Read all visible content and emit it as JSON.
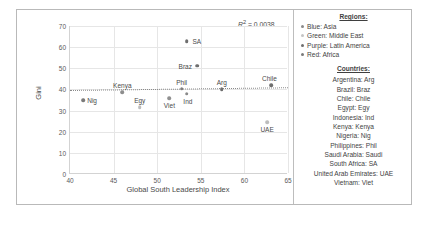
{
  "chart_data": {
    "type": "scatter",
    "title": "",
    "xlabel": "Global South Leadership Index",
    "ylabel": "Gini",
    "xlim": [
      40,
      65
    ],
    "ylim": [
      0,
      70
    ],
    "xticks": [
      40,
      45,
      50,
      55,
      60,
      65
    ],
    "yticks": [
      0,
      10,
      20,
      30,
      40,
      50,
      60,
      70
    ],
    "grid": true,
    "annotation": "R² = 0.0038",
    "r2_prefix": "R",
    "r2_sup": "2",
    "r2_value": "= 0.0038",
    "trendline": {
      "x0": 40,
      "y0": 39.6,
      "x1": 65,
      "y1": 40.9,
      "style": "dotted"
    },
    "points": [
      {
        "label": "Nig",
        "x": 41.5,
        "y": 35.0,
        "color": "#7a7a7a",
        "label_dx": 9,
        "label_dy": 0
      },
      {
        "label": "Kenya",
        "x": 46.0,
        "y": 38.7,
        "color": "#8d8d8d",
        "label_dx": 0,
        "label_dy": -7
      },
      {
        "label": "Egy",
        "x": 48.0,
        "y": 31.5,
        "color": "#bdbdbd",
        "label_dx": 0,
        "label_dy": -7
      },
      {
        "label": "Viet",
        "x": 51.4,
        "y": 35.8,
        "color": "#909090",
        "label_dx": 0,
        "label_dy": 7
      },
      {
        "label": "Phil",
        "x": 52.8,
        "y": 40.3,
        "color": "#7d7d7d",
        "label_dx": 0,
        "label_dy": -7
      },
      {
        "label": "Ind",
        "x": 53.4,
        "y": 38.0,
        "color": "#8a8a8a",
        "label_dx": 1,
        "label_dy": 7
      },
      {
        "label": "SA",
        "x": 53.4,
        "y": 62.8,
        "color": "#6e6e6e",
        "label_dx": 10,
        "label_dy": 0
      },
      {
        "label": "Braz",
        "x": 54.6,
        "y": 51.3,
        "color": "#6e6e6e",
        "label_dx": -12,
        "label_dy": 0
      },
      {
        "label": "Arg",
        "x": 57.4,
        "y": 40.0,
        "color": "#6e6e6e",
        "label_dx": 0,
        "label_dy": -7
      },
      {
        "label": "Chile",
        "x": 63.1,
        "y": 42.0,
        "color": "#6e6e6e",
        "label_dx": -2,
        "label_dy": -7
      },
      {
        "label": "UAE",
        "x": 62.6,
        "y": 24.6,
        "color": "#bdbdbd",
        "label_dx": 0,
        "label_dy": 7
      }
    ]
  },
  "legend": {
    "regions_heading": "Regions:",
    "regions": [
      {
        "label": "Blue: Asia",
        "color": "#8a8a8a"
      },
      {
        "label": "Green: Middle East",
        "color": "#c4c4c4"
      },
      {
        "label": "Purple: Latin America",
        "color": "#6e6e6e"
      },
      {
        "label": "Red: Africa",
        "color": "#7a7a7a"
      }
    ],
    "countries_heading": "Countries:",
    "countries": [
      "Argentina: Arg",
      "Brazil: Braz",
      "Chile: Chile",
      "Egypt: Egy",
      "Indonesia: Ind",
      "Kenya: Kenya",
      "Nigeria: Nig",
      "Philippines: Phil",
      "Saudi Arabia: Saudi",
      "South Africa: SA",
      "United Arab Emirates: UAE",
      "Vietnam: Viet"
    ]
  }
}
